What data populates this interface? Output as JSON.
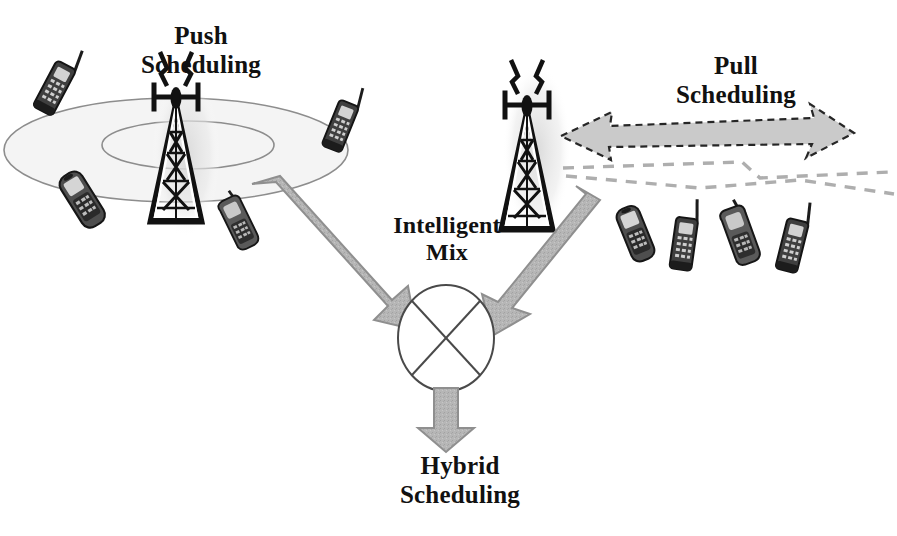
{
  "figure": {
    "kind": "concept-diagram",
    "background_color": "#ffffff",
    "title_labels": {
      "push": "Push\nScheduling",
      "pull": "Pull\nScheduling",
      "mix": "Intelligent\nMix",
      "hybrid": "Hybrid\nScheduling"
    }
  },
  "palette": {
    "ink": "#111111",
    "arrow_fill": "#b3b3b3",
    "arrow_stroke": "#8a8a8a",
    "dashed_arrow_fill": "#c9c9c9",
    "dashed_stroke": "#333333",
    "coverage_fill": "#f2f2f2",
    "coverage_stroke": "#777777",
    "haze": "#e2e2e2",
    "phone_body": "#4a4a4a",
    "phone_dark": "#1c1c1c",
    "phone_screen": "#cfcfcf"
  },
  "nodes": {
    "push_tower": {
      "name": "Broadcast tower (push)",
      "cx": 176,
      "base_y": 222,
      "height": 132
    },
    "pull_tower": {
      "name": "Broadcast tower (pull)",
      "cx": 527,
      "base_y": 232,
      "height": 150
    },
    "mixer": {
      "name": "Intelligent mix node",
      "cx": 446,
      "cy": 338,
      "rx": 48,
      "ry": 52,
      "glyph": "X"
    }
  },
  "coverage": {
    "outer": {
      "cx": 176,
      "cy": 150,
      "rx": 172,
      "ry": 52
    },
    "inner": {
      "cx": 185,
      "cy": 145,
      "rx": 85,
      "ry": 24
    }
  },
  "arrows": {
    "push_to_mix": {
      "label": "push feed arrow",
      "from": [
        262,
        196
      ],
      "to": [
        418,
        322
      ],
      "style": "solid-gray"
    },
    "pull_to_mix": {
      "label": "pull feed arrow",
      "from": [
        568,
        200
      ],
      "to": [
        478,
        322
      ],
      "style": "solid-gray"
    },
    "mix_to_hybrid": {
      "label": "hybrid output arrow",
      "from": [
        446,
        390
      ],
      "to": [
        446,
        450
      ],
      "style": "solid-gray"
    },
    "pull_request": {
      "label": "pull request arrow",
      "from": [
        842,
        135
      ],
      "to": [
        561,
        135
      ],
      "style": "dashed-outline-gray",
      "direction": "left"
    }
  },
  "links": [
    {
      "name": "pull link upper",
      "style": "dashed-gray"
    },
    {
      "name": "pull link lower",
      "style": "dashed-gray"
    }
  ],
  "phones": [
    {
      "id": "phone-push-1",
      "x": 46,
      "y": 42,
      "rot": 28,
      "scale": 1.0,
      "type": "antenna-bar"
    },
    {
      "id": "phone-push-2",
      "x": 332,
      "y": 82,
      "rot": 22,
      "scale": 0.95,
      "type": "antenna-bar"
    },
    {
      "id": "phone-push-3",
      "x": 64,
      "y": 172,
      "rot": -32,
      "scale": 1.05,
      "type": "candybar"
    },
    {
      "id": "phone-push-4",
      "x": 222,
      "y": 198,
      "rot": -26,
      "scale": 0.95,
      "type": "flip"
    },
    {
      "id": "phone-pull-1",
      "x": 620,
      "y": 200,
      "rot": -22,
      "scale": 1.0,
      "type": "candybar"
    },
    {
      "id": "phone-pull-2",
      "x": 672,
      "y": 198,
      "rot": 8,
      "scale": 1.0,
      "type": "antenna-bar"
    },
    {
      "id": "phone-pull-3",
      "x": 722,
      "y": 200,
      "rot": -20,
      "scale": 1.0,
      "type": "flip"
    },
    {
      "id": "phone-pull-4",
      "x": 780,
      "y": 200,
      "rot": 14,
      "scale": 1.0,
      "type": "antenna-bar"
    }
  ]
}
